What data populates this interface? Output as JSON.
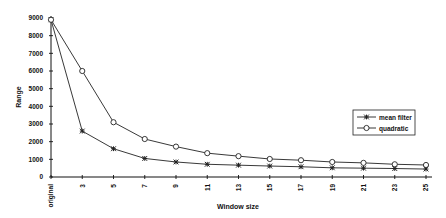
{
  "chart_data": {
    "type": "line",
    "title": "",
    "xlabel": "Window size",
    "ylabel": "Range",
    "ylim": [
      0,
      9000
    ],
    "yticks": [
      0,
      1000,
      2000,
      3000,
      4000,
      5000,
      6000,
      7000,
      8000,
      9000
    ],
    "categories": [
      "original",
      "3",
      "5",
      "7",
      "9",
      "11",
      "13",
      "15",
      "17",
      "19",
      "21",
      "23",
      "25"
    ],
    "grid": false,
    "legend_position": "right",
    "series": [
      {
        "name": "mean filter",
        "marker": "asterisk",
        "values": [
          8900,
          2600,
          1600,
          1050,
          850,
          720,
          670,
          620,
          580,
          520,
          500,
          480,
          450
        ]
      },
      {
        "name": "quadratic",
        "marker": "open-circle",
        "values": [
          8900,
          6000,
          3100,
          2150,
          1720,
          1350,
          1180,
          1020,
          950,
          850,
          800,
          720,
          680
        ]
      }
    ]
  },
  "colors": {
    "line": "#222222",
    "axis": "#111111",
    "background": "#ffffff"
  }
}
